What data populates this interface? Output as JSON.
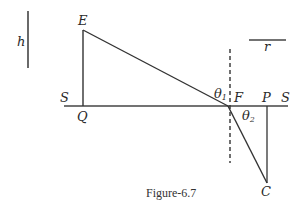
{
  "figure": {
    "caption": "Figure-6.7",
    "labels": {
      "E": "E",
      "Q": "Q",
      "S_left": "S",
      "F": "F",
      "P": "P",
      "S_right": "S",
      "C": "C",
      "h": "h",
      "r": "r",
      "theta1": "θ",
      "theta1_sub": "1",
      "theta2": "θ",
      "theta2_sub": "2"
    },
    "colors": {
      "line": "#333333",
      "text": "#2a2a2a"
    }
  }
}
